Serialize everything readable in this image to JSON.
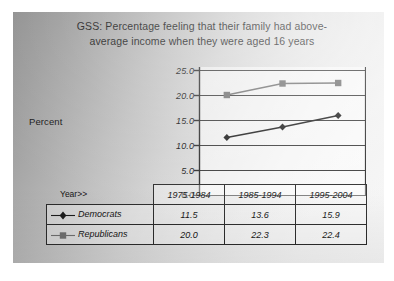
{
  "chart_data": {
    "type": "line",
    "title_line1": "GSS:  Percentage feeling that their family had above-",
    "title_line2": "average income when they were aged 16 years",
    "xlabel": "Year>>",
    "ylabel": "Percent",
    "categories": [
      "1975-1984",
      "1985-1994",
      "1995-2004"
    ],
    "series": [
      {
        "name": "Democrats",
        "marker": "diamond",
        "color": "#1c1c1c",
        "values": [
          11.5,
          13.6,
          15.9
        ]
      },
      {
        "name": "Republicans",
        "marker": "square",
        "color": "#6e6e6e",
        "values": [
          20.0,
          22.3,
          22.4
        ]
      }
    ],
    "ylim": [
      0.0,
      25.0
    ],
    "ytick_labels": [
      "25.0",
      "20.0",
      "15.0",
      "10.0",
      "5.0",
      "0.0"
    ],
    "ytick_values": [
      25.0,
      20.0,
      15.0,
      10.0,
      5.0,
      0.0
    ],
    "grid": true,
    "grid_axis": "y",
    "legend_position": "table-row-labels"
  },
  "table": {
    "corner_label": "",
    "headers": [
      "1975-1984",
      "1985-1994",
      "1995-2004"
    ],
    "rows": [
      {
        "label": "Democrats",
        "cells": [
          "11.5",
          "13.6",
          "15.9"
        ]
      },
      {
        "label": "Republicans",
        "cells": [
          "20.0",
          "22.3",
          "22.4"
        ]
      }
    ]
  },
  "colors": {
    "democrats": "#1c1c1c",
    "republicans": "#6e6e6e",
    "axis": "#2b2b2b",
    "grid": "#3a3a3a",
    "text": "#141414"
  }
}
